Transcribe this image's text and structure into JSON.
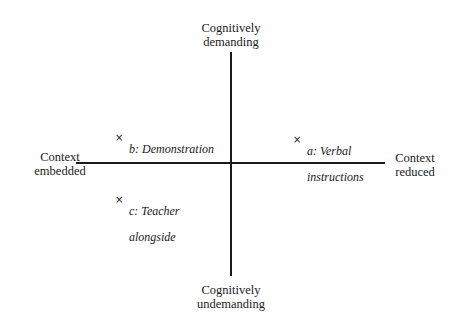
{
  "diagram": {
    "type": "quadrant",
    "axes": {
      "vertical": {
        "top_label": "Cognitively demanding",
        "bottom_label": "Cognitively undemanding"
      },
      "horizontal": {
        "left_label": "Context embedded",
        "right_label": "Context reduced"
      }
    },
    "labels": {
      "top_line1": "Cognitively",
      "top_line2": "demanding",
      "bottom_line1": "Cognitively",
      "bottom_line2": "undemanding",
      "left_line1": "Context",
      "left_line2": "embedded",
      "right_line1": "Context",
      "right_line2": "reduced"
    },
    "points": [
      {
        "id": "a",
        "marker": "×",
        "line1": "a: Verbal",
        "line2": "instructions",
        "quadrant": "top-right"
      },
      {
        "id": "b",
        "marker": "×",
        "line1": "b: Demonstration",
        "line2": "",
        "quadrant": "top-left"
      },
      {
        "id": "c",
        "marker": "×",
        "line1": "c: Teacher",
        "line2": "alongside",
        "quadrant": "bottom-left"
      }
    ]
  }
}
